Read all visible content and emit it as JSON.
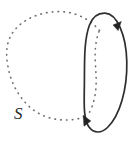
{
  "figure": {
    "title": "Circle S intersecting an oriented closed curve",
    "background_color": "#ffffff",
    "width": 135,
    "height": 143,
    "labels": [
      {
        "id": "curve-label-s",
        "text": "S",
        "style": "italic",
        "x": 14,
        "y": 119,
        "color": "#2a2a2c",
        "font_size": 17
      }
    ],
    "shapes": {
      "dotted_circle": {
        "name": "circle-s",
        "style": "dotted",
        "color": "#6e6e70",
        "stroke_width": 1.6,
        "center_x": 60,
        "center_y": 66,
        "radius_x": 52,
        "radius_y": 54,
        "description": "Dotted circle labeled S drawn in perspective, its right portion passing behind the solid oriented ellipse"
      },
      "solid_ellipse": {
        "name": "oriented-closed-curve",
        "style": "solid",
        "color": "#2e2e30",
        "stroke_width": 1.7,
        "center_x": 105.5,
        "center_y": 73,
        "radius_x": 21.5,
        "radius_y": 60,
        "rotation_deg": -5,
        "description": "Solid narrow ellipse with orientation arrowheads"
      }
    },
    "arrowheads": [
      {
        "id": "arrowhead-upper-right",
        "x": 117,
        "y": 25,
        "angle_deg": 62,
        "color": "#242426"
      },
      {
        "id": "arrowhead-lower-left",
        "x": 86.5,
        "y": 121,
        "angle_deg": 62,
        "color": "#242426"
      }
    ]
  }
}
